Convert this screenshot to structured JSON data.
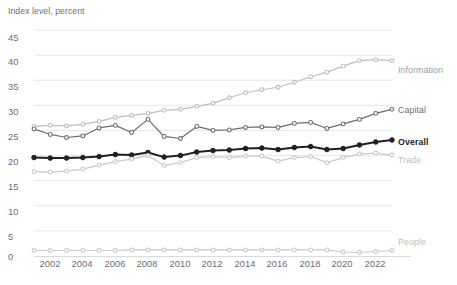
{
  "chart_data": {
    "type": "line",
    "title": "Index level, percent",
    "xlabel": "",
    "ylabel": "Index level, percent",
    "ylim": [
      0,
      45
    ],
    "xlim": [
      2001,
      2023
    ],
    "yticks": [
      0,
      5,
      10,
      15,
      20,
      25,
      30,
      35,
      40,
      45
    ],
    "xticks": [
      2002,
      2004,
      2006,
      2008,
      2010,
      2012,
      2014,
      2016,
      2018,
      2020,
      2022
    ],
    "grid": true,
    "legend_position": "right-inline",
    "x": [
      2001,
      2002,
      2003,
      2004,
      2005,
      2006,
      2007,
      2008,
      2009,
      2010,
      2011,
      2012,
      2013,
      2014,
      2015,
      2016,
      2017,
      2018,
      2019,
      2020,
      2021,
      2022,
      2023
    ],
    "series": [
      {
        "name": "Information",
        "color": "#bcbec0",
        "values": [
          25.8,
          26.0,
          25.9,
          26.2,
          26.8,
          27.6,
          28.0,
          28.4,
          29.0,
          29.2,
          29.8,
          30.4,
          31.5,
          32.5,
          33.1,
          33.6,
          34.6,
          35.7,
          36.6,
          37.8,
          38.9,
          39.1,
          38.9
        ]
      },
      {
        "name": "Capital",
        "color": "#6d6e71",
        "values": [
          25.3,
          24.2,
          23.6,
          23.9,
          25.5,
          26.0,
          24.6,
          27.2,
          23.8,
          23.4,
          25.8,
          25.0,
          25.1,
          25.6,
          25.7,
          25.6,
          26.4,
          26.6,
          25.4,
          26.3,
          27.2,
          28.4,
          29.2
        ]
      },
      {
        "name": "Overall",
        "color": "#231f20",
        "values": [
          19.6,
          19.5,
          19.5,
          19.6,
          19.8,
          20.2,
          20.1,
          20.6,
          19.7,
          20.0,
          20.7,
          21.0,
          21.1,
          21.4,
          21.5,
          21.2,
          21.6,
          21.8,
          21.2,
          21.4,
          22.1,
          22.7,
          23.1
        ]
      },
      {
        "name": "Trade",
        "color": "#c7c9cb",
        "values": [
          16.8,
          16.7,
          16.9,
          17.3,
          18.1,
          18.8,
          19.3,
          20.0,
          18.0,
          18.6,
          19.6,
          19.8,
          19.6,
          19.9,
          19.9,
          18.9,
          19.6,
          19.8,
          18.6,
          19.6,
          20.3,
          20.5,
          20.1
        ]
      },
      {
        "name": "People",
        "color": "#c7c9cb",
        "values": [
          1.1,
          1.1,
          1.1,
          1.1,
          1.1,
          1.1,
          1.2,
          1.2,
          1.2,
          1.2,
          1.2,
          1.2,
          1.2,
          1.2,
          1.2,
          1.2,
          1.2,
          1.2,
          1.2,
          0.8,
          0.7,
          0.9,
          1.1
        ]
      }
    ]
  },
  "axis": {
    "title": "Index level, percent",
    "y_labels": [
      "45",
      "40",
      "35",
      "30",
      "25",
      "20",
      "15",
      "10",
      "5",
      "0"
    ],
    "x_labels": [
      "2002",
      "2004",
      "2006",
      "2008",
      "2010",
      "2012",
      "2014",
      "2016",
      "2018",
      "2020",
      "2022"
    ]
  },
  "legend": {
    "information": "Information",
    "capital": "Capital",
    "overall": "Overall",
    "trade": "Trade",
    "people": "People"
  },
  "colors": {
    "information": "#bcbec0",
    "capital": "#6d6e71",
    "overall": "#231f20",
    "trade": "#c7c9cb",
    "people": "#c7c9cb",
    "grid": "#e6e7e8",
    "text": "#6d6e71",
    "background": "#ffffff"
  }
}
